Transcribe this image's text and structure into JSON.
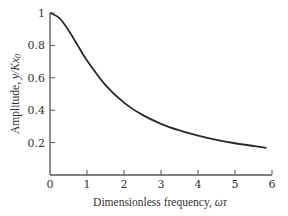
{
  "chart_data": {
    "type": "line",
    "title": "",
    "xlabel": "Dimensionless frequency, ωτ",
    "xlabel_prefix": "Dimensionless frequency, ",
    "xlabel_symbol": "ωτ",
    "ylabel": "Amplitude, y/Kx₀",
    "ylabel_prefix": "Amplitude, ",
    "ylabel_symbol": "y/Kx",
    "ylabel_subscript": "0",
    "xlim": [
      0,
      6
    ],
    "ylim": [
      0,
      1
    ],
    "xticks": [
      "0",
      "1",
      "2",
      "3",
      "4",
      "5",
      "6"
    ],
    "yticks": [
      "0.2",
      "0.4",
      "0.6",
      "0.8",
      "1"
    ],
    "grid": false,
    "legend": null,
    "series": [
      {
        "name": "Amplitude ratio 1/sqrt(1+(ωτ)²)",
        "x": [
          0,
          0.25,
          0.5,
          0.75,
          1,
          1.5,
          2,
          2.5,
          3,
          3.5,
          4,
          4.5,
          5,
          5.5,
          5.85
        ],
        "y": [
          1.0,
          0.97,
          0.894,
          0.8,
          0.707,
          0.555,
          0.447,
          0.371,
          0.316,
          0.275,
          0.243,
          0.217,
          0.196,
          0.179,
          0.168
        ]
      }
    ]
  },
  "colors": {
    "curve": "#2a2a2a",
    "axis": "#555555",
    "text": "#333333"
  }
}
